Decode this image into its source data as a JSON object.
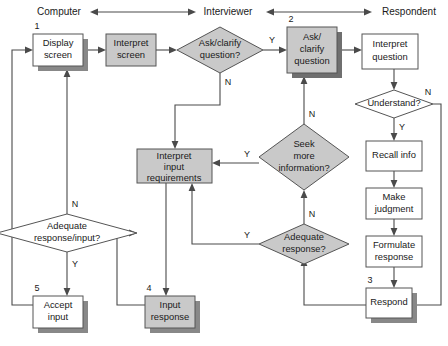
{
  "diagram": {
    "colors": {
      "shape_gray": "#c9c9c9",
      "shape_white": "#ffffff",
      "stroke": "#555555",
      "shadow": "#888888",
      "edge": "#4a4a4a",
      "background": "#ffffff"
    },
    "headers": [
      {
        "id": "header-computer",
        "label": "Computer"
      },
      {
        "id": "header-interviewer",
        "label": "Interviewer"
      },
      {
        "id": "header-respondent",
        "label": "Respondent"
      }
    ],
    "nodes": [
      {
        "id": "display-screen",
        "label": "Display screen",
        "lines": [
          "Display",
          "screen"
        ],
        "shape": "process",
        "fill": "white",
        "shadow": true,
        "step": "1"
      },
      {
        "id": "interpret-screen",
        "label": "Interpret screen",
        "lines": [
          "Interpret",
          "screen"
        ],
        "shape": "process",
        "fill": "gray",
        "shadow": false,
        "step": ""
      },
      {
        "id": "ask-clarify-question-q",
        "label": "Ask/clarify question?",
        "lines": [
          "Ask/clarify",
          "question?"
        ],
        "shape": "decision",
        "fill": "gray",
        "shadow": false,
        "step": ""
      },
      {
        "id": "ask-clarify-question",
        "label": "Ask/clarify question",
        "lines": [
          "Ask/",
          "clarify",
          "question"
        ],
        "shape": "process",
        "fill": "gray",
        "shadow": true,
        "step": "2"
      },
      {
        "id": "interpret-question",
        "label": "Interpret question",
        "lines": [
          "Interpret",
          "question"
        ],
        "shape": "process",
        "fill": "white",
        "shadow": false,
        "step": ""
      },
      {
        "id": "understand-q",
        "label": "Understand?",
        "lines": [
          "Understand?"
        ],
        "shape": "decision",
        "fill": "white",
        "shadow": false,
        "step": ""
      },
      {
        "id": "recall-info",
        "label": "Recall info",
        "lines": [
          "Recall info"
        ],
        "shape": "process",
        "fill": "white",
        "shadow": false,
        "step": ""
      },
      {
        "id": "make-judgment",
        "label": "Make judgment",
        "lines": [
          "Make",
          "judgment"
        ],
        "shape": "process",
        "fill": "white",
        "shadow": false,
        "step": ""
      },
      {
        "id": "formulate-response",
        "label": "Formulate response",
        "lines": [
          "Formulate",
          "response"
        ],
        "shape": "process",
        "fill": "white",
        "shadow": false,
        "step": ""
      },
      {
        "id": "respond",
        "label": "Respond",
        "lines": [
          "Respond"
        ],
        "shape": "process",
        "fill": "white",
        "shadow": true,
        "step": "3"
      },
      {
        "id": "seek-more-information-q",
        "label": "Seek more information?",
        "lines": [
          "Seek",
          "more",
          "information?"
        ],
        "shape": "decision",
        "fill": "gray",
        "shadow": false,
        "step": ""
      },
      {
        "id": "adequate-response-q",
        "label": "Adequate response?",
        "lines": [
          "Adequate",
          "response?"
        ],
        "shape": "decision",
        "fill": "gray",
        "shadow": false,
        "step": ""
      },
      {
        "id": "interpret-input-requirements",
        "label": "Interpret input requirements",
        "lines": [
          "Interpret",
          "input",
          "requirements"
        ],
        "shape": "process",
        "fill": "gray",
        "shadow": false,
        "step": ""
      },
      {
        "id": "input-response",
        "label": "Input response",
        "lines": [
          "Input",
          "response"
        ],
        "shape": "process",
        "fill": "gray",
        "shadow": true,
        "step": "4"
      },
      {
        "id": "adequate-response-input-q",
        "label": "Adequate response/input?",
        "lines": [
          "Adequate",
          "response/input?"
        ],
        "shape": "decision",
        "fill": "white",
        "shadow": false,
        "step": ""
      },
      {
        "id": "accept-input",
        "label": "Accept input",
        "lines": [
          "Accept",
          "input"
        ],
        "shape": "process",
        "fill": "white",
        "shadow": true,
        "step": "5"
      }
    ],
    "branch_labels": [
      {
        "id": "ask-clarify-yes",
        "label": "Y"
      },
      {
        "id": "ask-clarify-no",
        "label": "N"
      },
      {
        "id": "understand-no",
        "label": "N"
      },
      {
        "id": "understand-yes",
        "label": "Y"
      },
      {
        "id": "seek-more-no",
        "label": "N"
      },
      {
        "id": "seek-more-yes",
        "label": "Y"
      },
      {
        "id": "adequate-response-no",
        "label": "N"
      },
      {
        "id": "adequate-response-yes",
        "label": "Y"
      },
      {
        "id": "adequate-response-input-no",
        "label": "N"
      },
      {
        "id": "adequate-response-input-yes",
        "label": "Y"
      }
    ],
    "step_numbers": [
      "1",
      "2",
      "3",
      "4",
      "5"
    ]
  }
}
